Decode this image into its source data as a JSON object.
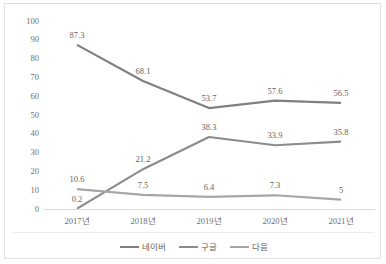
{
  "chart_data": {
    "type": "line",
    "title": "",
    "xlabel": "",
    "ylabel": "",
    "categories": [
      "2017년",
      "2018년",
      "2019년",
      "2020년",
      "2021년"
    ],
    "ylim": [
      0,
      100
    ],
    "yticks": [
      "0",
      "10",
      "20",
      "30",
      "40",
      "50",
      "60",
      "70",
      "80",
      "90",
      "100"
    ],
    "grid": false,
    "legend_position": "bottom",
    "series": [
      {
        "name": "네이버",
        "color": "#808080",
        "values": [
          87.3,
          68.1,
          53.7,
          57.6,
          56.5
        ],
        "labels": [
          "87.3",
          "68.1",
          "53.7",
          "57.6",
          "56.5"
        ]
      },
      {
        "name": "구글",
        "color": "#8c8c8c",
        "values": [
          0.2,
          21.2,
          38.3,
          33.9,
          35.8
        ],
        "labels": [
          "0.2",
          "21.2",
          "38.3",
          "33.9",
          "35.8"
        ]
      },
      {
        "name": "다음",
        "color": "#a6a6a6",
        "values": [
          10.6,
          7.5,
          6.4,
          7.3,
          5.0
        ],
        "labels": [
          "10.6",
          "7.5",
          "6.4",
          "7.3",
          "5"
        ]
      }
    ]
  },
  "colors": {
    "border": "#e2e2e2",
    "axis": "#d9d9d9",
    "tick_text": "#6e6e6e",
    "label_text": "#636363",
    "background": "#ffffff"
  }
}
